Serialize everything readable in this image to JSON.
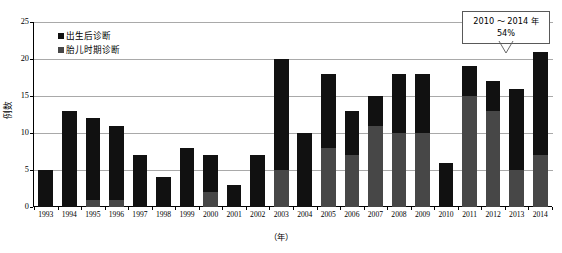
{
  "chart_data": {
    "type": "bar",
    "stacked": true,
    "title": "",
    "xlabel": "（年）",
    "ylabel": "例数",
    "ylim": [
      0,
      25
    ],
    "yticks": [
      0,
      5,
      10,
      15,
      20,
      25
    ],
    "grid": true,
    "legend_position": "top-left",
    "categories": [
      "1993",
      "1994",
      "1995",
      "1996",
      "1997",
      "1998",
      "1999",
      "2000",
      "2001",
      "2002",
      "2003",
      "2004",
      "2005",
      "2006",
      "2007",
      "2008",
      "2009",
      "2010",
      "2011",
      "2012",
      "2013",
      "2014"
    ],
    "series": [
      {
        "name": "胎儿时期诊断",
        "color": "#474747",
        "values": [
          0,
          0,
          1,
          1,
          0,
          0,
          0,
          2,
          0,
          0,
          5,
          0,
          8,
          7,
          11,
          10,
          10,
          0,
          15,
          13,
          5,
          7
        ]
      },
      {
        "name": "出生后诊断",
        "color": "#111111",
        "values": [
          5,
          13,
          11,
          10,
          7,
          4,
          8,
          5,
          3,
          7,
          15,
          10,
          10,
          6,
          4,
          8,
          8,
          6,
          4,
          4,
          11,
          14
        ]
      }
    ],
    "totals": [
      5,
      13,
      12,
      11,
      7,
      4,
      8,
      7,
      3,
      7,
      20,
      10,
      18,
      13,
      15,
      18,
      18,
      6,
      19,
      17,
      16,
      21
    ],
    "annotation": {
      "line1": "2010 ～ 2014 年",
      "line2": "54%",
      "points_to": "2013"
    }
  },
  "legend": {
    "items": [
      {
        "label": "出生后诊断",
        "swatch": "legend-swatch-postnatal"
      },
      {
        "label": "胎儿时期诊断",
        "swatch": "legend-swatch-fetal"
      }
    ]
  },
  "axes": {
    "y_label": "例数",
    "x_label": "（年）",
    "y_ticks": [
      "0",
      "5",
      "10",
      "15",
      "20",
      "25"
    ],
    "x_ticks": [
      "1993",
      "1994",
      "1995",
      "1996",
      "1997",
      "1998",
      "1999",
      "2000",
      "2001",
      "2002",
      "2003",
      "2004",
      "2005",
      "2006",
      "2007",
      "2008",
      "2009",
      "2010",
      "2011",
      "2012",
      "2013",
      "2014"
    ]
  },
  "callout": {
    "line1": "2010 ～ 2014 年",
    "line2": "54%"
  },
  "colors": {
    "postnatal": "#111111",
    "fetal": "#474747",
    "grid": "#a9a9a9",
    "axis": "#000000",
    "callout_border": "#595959"
  }
}
